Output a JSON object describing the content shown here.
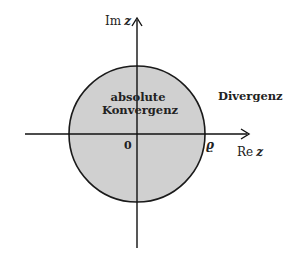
{
  "diagram": {
    "axes": {
      "x_label_main": "Re",
      "x_label_var": "z",
      "y_label_main": "Im",
      "y_label_var": "z",
      "origin_label": "0"
    },
    "circle": {
      "radius_label": "ϱ",
      "inside_line1": "absolute",
      "inside_line2": "Konvergenz",
      "fill_color": "#d0d0d0",
      "stroke_color": "#1a1a1a"
    },
    "outside_label": "Divergenz"
  }
}
